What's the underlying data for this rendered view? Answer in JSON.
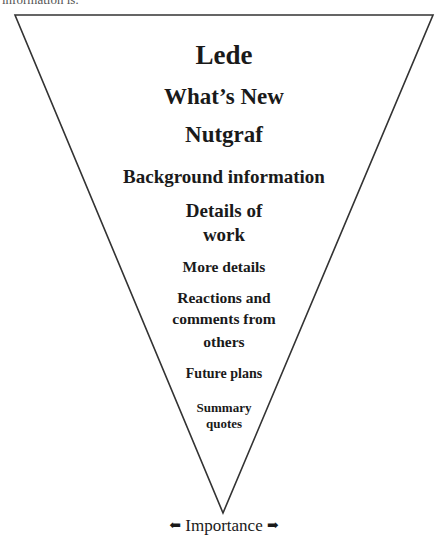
{
  "caption": {
    "clipped_text": "information is:"
  },
  "diagram": {
    "type": "inverted-pyramid",
    "shape": {
      "top_left": [
        15,
        15
      ],
      "top_right": [
        433,
        15
      ],
      "apex": [
        223,
        513
      ],
      "stroke_color": "#333333"
    },
    "layers": [
      {
        "id": "lede",
        "lines": [
          "Lede"
        ]
      },
      {
        "id": "whats-new",
        "lines": [
          "What’s New"
        ]
      },
      {
        "id": "nutgraf",
        "lines": [
          "Nutgraf"
        ]
      },
      {
        "id": "background",
        "lines": [
          "Background information"
        ]
      },
      {
        "id": "details",
        "lines": [
          "Details of",
          "work"
        ]
      },
      {
        "id": "more-details",
        "lines": [
          "More details"
        ]
      },
      {
        "id": "reactions",
        "lines": [
          "Reactions and",
          "comments from",
          "others"
        ]
      },
      {
        "id": "future-plans",
        "lines": [
          "Future plans"
        ]
      },
      {
        "id": "summary-quotes",
        "lines": [
          "Summary",
          "quotes"
        ]
      }
    ],
    "axis": {
      "label": "Importance",
      "left_arrow": "⬅",
      "right_arrow": "➡"
    }
  }
}
